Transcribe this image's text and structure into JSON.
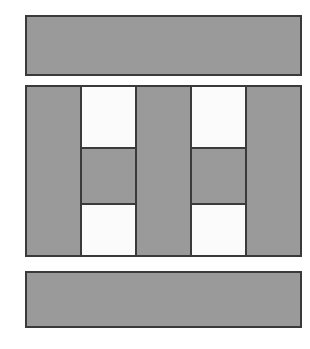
{
  "figure": {
    "title": "",
    "background_color": "#ffffff",
    "width": 310,
    "height": 349,
    "palette": {
      "fill_gray": "#9a9a9a",
      "fill_light": "#fbfbfb",
      "stroke": "#3a3a3a"
    },
    "blocks": [
      {
        "name": "top-bar",
        "label": "",
        "x": 25,
        "y": 15,
        "width": 277,
        "height": 61,
        "fill": "#9a9a9a"
      },
      {
        "name": "middle-panel",
        "label": "",
        "x": 25,
        "y": 85,
        "width": 277,
        "height": 172,
        "fill": "#9a9a9a"
      },
      {
        "name": "bottom-bar",
        "label": "",
        "x": 25,
        "y": 271,
        "width": 277,
        "height": 57,
        "fill": "#9a9a9a"
      }
    ],
    "columns": [
      {
        "name": "left-cell-column",
        "label": "",
        "x": 80,
        "width": 57,
        "cells": [
          {
            "label": "",
            "tone": "light",
            "height": 60
          },
          {
            "label": "",
            "tone": "dark",
            "height": 58
          },
          {
            "label": "",
            "tone": "light",
            "height": 54
          }
        ]
      },
      {
        "name": "right-cell-column",
        "label": "",
        "x": 190,
        "width": 57,
        "cells": [
          {
            "label": "",
            "tone": "light",
            "height": 60
          },
          {
            "label": "",
            "tone": "dark",
            "height": 58
          },
          {
            "label": "",
            "tone": "light",
            "height": 54
          }
        ]
      }
    ]
  }
}
